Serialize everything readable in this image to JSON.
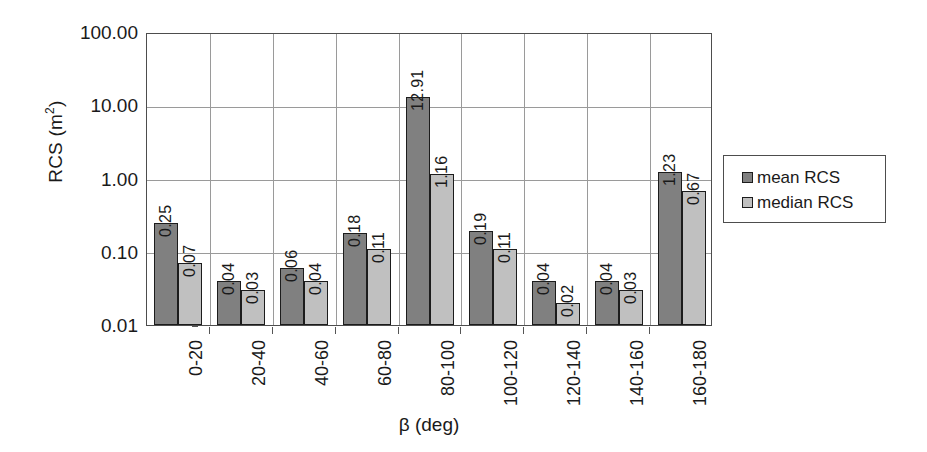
{
  "chart_data": {
    "type": "bar",
    "title": "",
    "xlabel": "β (deg)",
    "ylabel": "RCS (m²)",
    "ylabel_base": "RCS (m",
    "ylabel_sup": "2",
    "ylabel_close": ")",
    "yscale": "log",
    "ylim": [
      0.01,
      100
    ],
    "ytick_labels": [
      "100.00",
      "10.00",
      "1.00",
      "0.10",
      "0.01"
    ],
    "ytick_values": [
      100,
      10,
      1,
      0.1,
      0.01
    ],
    "grid": "both",
    "legend_position": "right",
    "categories": [
      "0-20",
      "20-40",
      "40-60",
      "60-80",
      "80-100",
      "100-120",
      "120-140",
      "140-160",
      "160-180"
    ],
    "series": [
      {
        "name": "mean RCS",
        "color": "#808080",
        "values": [
          0.25,
          0.04,
          0.06,
          0.18,
          12.91,
          0.19,
          0.04,
          0.04,
          1.23
        ],
        "labels": [
          "0.25",
          "0.04",
          "0.06",
          "0.18",
          "12.91",
          "0.19",
          "0.04",
          "0.04",
          "1.23"
        ]
      },
      {
        "name": "median RCS",
        "color": "#c0c0c0",
        "values": [
          0.07,
          0.03,
          0.04,
          0.11,
          1.16,
          0.11,
          0.02,
          0.03,
          0.67
        ],
        "labels": [
          "0.07",
          "0.03",
          "0.04",
          "0.11",
          "1.16",
          "0.11",
          "0.02",
          "0.03",
          "0.67"
        ]
      }
    ]
  },
  "legend": {
    "items": [
      {
        "label": "mean RCS",
        "color": "#808080"
      },
      {
        "label": "median RCS",
        "color": "#c0c0c0"
      }
    ]
  }
}
